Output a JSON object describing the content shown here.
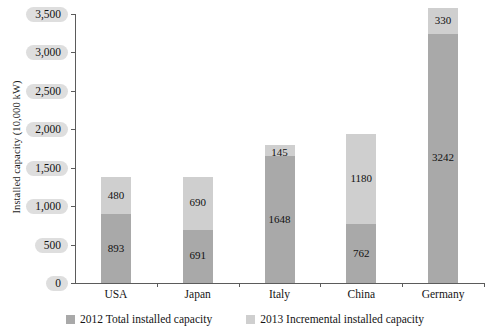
{
  "chart_data": {
    "type": "bar",
    "stacked": true,
    "title": "",
    "xlabel": "",
    "ylabel": "Installed capacity (10,000 kW)",
    "ylim": [
      0,
      3500
    ],
    "ytick_values": [
      0,
      500,
      1000,
      1500,
      2000,
      2500,
      3000,
      3500
    ],
    "ytick_labels": [
      "0",
      "500",
      "1,000",
      "1,500",
      "2,000",
      "2,500",
      "3,000",
      "3,500"
    ],
    "grid": false,
    "legend_position": "bottom",
    "categories": [
      "USA",
      "Japan",
      "Italy",
      "China",
      "Germany"
    ],
    "series": [
      {
        "name": "2012 Total installed capacity",
        "color": "#a9a9a9",
        "values": [
          893,
          691,
          1648,
          762,
          3242
        ]
      },
      {
        "name": "2013 Incremental installed capacity",
        "color": "#cfcfcf",
        "values": [
          480,
          690,
          145,
          1180,
          330
        ]
      }
    ],
    "totals": [
      1373,
      1381,
      1793,
      1942,
      3572
    ]
  },
  "axes": {
    "y_title": "Installed capacity (10,000 kW)"
  },
  "legend": {
    "items": [
      {
        "label": "2012 Total installed capacity",
        "key": "total"
      },
      {
        "label": "2013 Incremental installed capacity",
        "key": "incr"
      }
    ]
  }
}
